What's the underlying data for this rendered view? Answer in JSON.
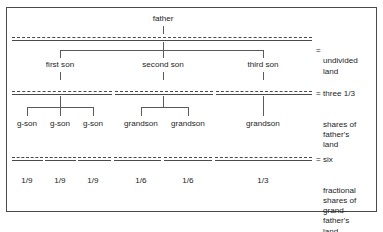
{
  "diagram": {
    "title_node": "father",
    "generations": {
      "sons": [
        "first son",
        "second son",
        "third son"
      ],
      "grandsons": [
        "g-son",
        "g-son",
        "g-son",
        "grandson",
        "grandson",
        "grandson"
      ],
      "shares": [
        "1/9",
        "1/9",
        "1/9",
        "1/6",
        "1/6",
        "1/3"
      ]
    },
    "legends": [
      {
        "id": "undivided",
        "prefix": "",
        "equals": "=",
        "lines": "undivided\nland"
      },
      {
        "id": "thirds",
        "prefix": "three 1/3",
        "equals": "=",
        "lines": "shares of\nfather's\nland"
      },
      {
        "id": "fractional",
        "prefix": "six",
        "equals": "=",
        "lines": "fractional\nshares of\ngrand-\nfather's\nland"
      }
    ],
    "colors": {
      "ink": "#1d1d1d",
      "rule": "#4a4a4a",
      "connector": "#5a5a5a",
      "background": "#ffffff"
    }
  }
}
